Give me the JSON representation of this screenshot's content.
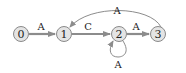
{
  "diagram": {
    "type": "state-machine",
    "nodes": [
      {
        "id": "0",
        "label": "0",
        "x": 21,
        "y": 34
      },
      {
        "id": "1",
        "label": "1",
        "x": 64,
        "y": 34
      },
      {
        "id": "2",
        "label": "2",
        "x": 119,
        "y": 34
      },
      {
        "id": "3",
        "label": "3",
        "x": 158,
        "y": 34
      }
    ],
    "edges": [
      {
        "from": "0",
        "to": "1",
        "label": "A"
      },
      {
        "from": "1",
        "to": "2",
        "label": "C"
      },
      {
        "from": "2",
        "to": "3",
        "label": "A"
      },
      {
        "from": "3",
        "to": "1",
        "label": "A"
      },
      {
        "from": "2",
        "to": "2",
        "label": "A"
      }
    ],
    "colors": {
      "node_fill": "#e4e4e4",
      "node_stroke": "#8a8a8a",
      "edge": "#8c8c8c",
      "text": "#222222"
    }
  }
}
